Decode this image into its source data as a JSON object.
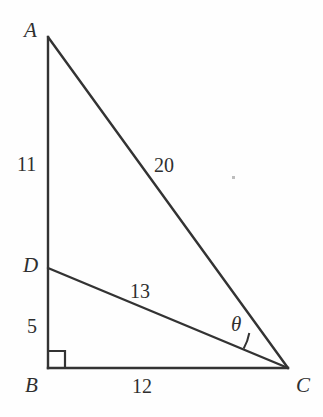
{
  "figure": {
    "type": "geometry-diagram",
    "background_color": "#fefefe",
    "stroke_color": "#333333",
    "text_color": "#2f2f2f"
  },
  "vertices": {
    "A": {
      "label": "A",
      "x": 48,
      "y": 37
    },
    "B": {
      "label": "B",
      "x": 48,
      "y": 368
    },
    "C": {
      "label": "C",
      "x": 288,
      "y": 368
    },
    "D": {
      "label": "D",
      "x": 48,
      "y": 268
    }
  },
  "segments": [
    {
      "name": "AB",
      "from": "A",
      "to": "B",
      "length_label": ""
    },
    {
      "name": "BC",
      "from": "B",
      "to": "C",
      "length_label": "12"
    },
    {
      "name": "AC",
      "from": "A",
      "to": "C",
      "length_label": "20"
    },
    {
      "name": "DC",
      "from": "D",
      "to": "C",
      "length_label": "13"
    }
  ],
  "lengths": {
    "AD": "11",
    "DB": "5",
    "BC": "12",
    "AC": "20",
    "DC": "13"
  },
  "angles": {
    "theta": {
      "label": "θ",
      "at_vertex": "C",
      "between": [
        "CD",
        "CA"
      ]
    },
    "right_angle": {
      "at_vertex": "B",
      "marker": "square",
      "size_px": 17
    }
  }
}
